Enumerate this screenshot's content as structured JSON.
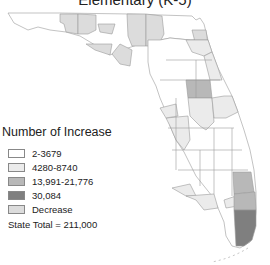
{
  "title": "Elementary (K-5)",
  "legend": {
    "title": "Number of Increase",
    "items": [
      {
        "label": "2-3679",
        "color": "#ffffff"
      },
      {
        "label": "4280-8740",
        "color": "#ebebeb"
      },
      {
        "label": "13,991-21,776",
        "color": "#b8b8b8"
      },
      {
        "label": "30,084",
        "color": "#7f7f7f"
      },
      {
        "label": "Decrease",
        "color": "#dcdcdc"
      }
    ]
  },
  "state_total": "State Total = 211,000",
  "colors": {
    "border": "#9a9a9a",
    "lowest": "#ffffff",
    "low": "#ebebeb",
    "mid": "#b8b8b8",
    "high": "#7f7f7f",
    "decrease": "#dcdcdc"
  }
}
